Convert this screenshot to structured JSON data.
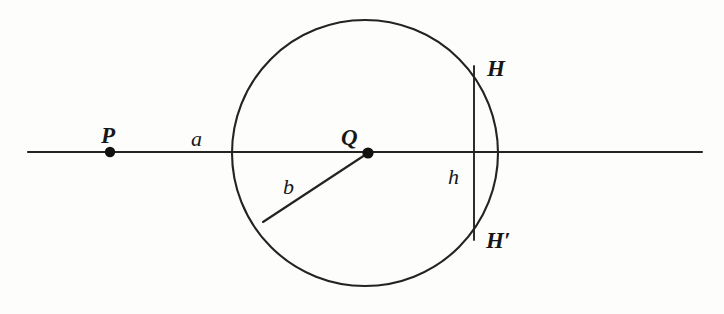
{
  "figure": {
    "background_color": "#fdfdfc",
    "stroke_color": "#232323",
    "canvas": {
      "width": 724,
      "height": 314
    }
  },
  "labels": {
    "point_p": "P",
    "point_q": "Q",
    "point_h": "H",
    "point_h_prime": "H′",
    "segment_a": "a",
    "segment_b": "b",
    "segment_h": "h"
  },
  "geometry": {
    "circle": {
      "cx": 365,
      "cy": 153,
      "r": 133
    },
    "baseline": {
      "x1": 28,
      "y1": 152,
      "x2": 702,
      "y2": 152
    },
    "point_p": {
      "x": 110,
      "y": 152
    },
    "point_q": {
      "x": 368,
      "y": 153
    },
    "radius_b": {
      "x1": 368,
      "y1": 153,
      "x2": 263,
      "y2": 222
    },
    "chord_hh_prime": {
      "x": 474,
      "y1": 66,
      "y2": 240
    },
    "dot_radius": 5
  },
  "label_positions": {
    "point_p": {
      "x": 101,
      "y": 124
    },
    "point_q": {
      "x": 341,
      "y": 126
    },
    "point_h": {
      "x": 487,
      "y": 57
    },
    "point_h_prime": {
      "x": 486,
      "y": 229
    },
    "segment_a": {
      "x": 191,
      "y": 128
    },
    "segment_b": {
      "x": 283,
      "y": 176
    },
    "segment_h": {
      "x": 448,
      "y": 166
    }
  }
}
